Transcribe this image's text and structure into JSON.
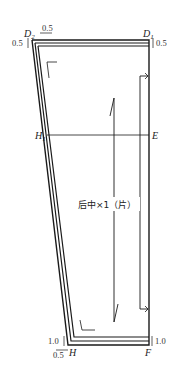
{
  "diagram": {
    "type": "garment-pattern-piece",
    "piece_label": "后中×1（片）",
    "points": {
      "D2": "D",
      "D2_sub": "2",
      "D1": "D",
      "D1_sub": "1",
      "H1": "H",
      "H1_sub": "1",
      "E": "E",
      "H": "H",
      "F": "F"
    },
    "seam_allowances": {
      "top_left_horizontal": "0.5",
      "top_left_vertical": "0.5",
      "top_right_vertical": "0.5",
      "bottom_left_vertical": "1.0",
      "bottom_left_horizontal": "0.5",
      "bottom_right_vertical": "1.0"
    },
    "colors": {
      "line": "#1a1a1a",
      "text": "#222222",
      "background": "#ffffff"
    }
  }
}
